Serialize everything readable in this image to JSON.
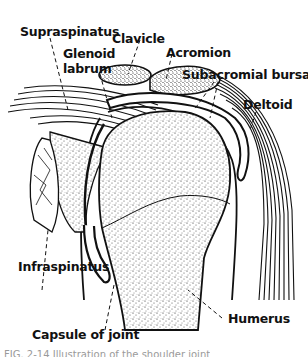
{
  "diagram": {
    "labels": {
      "supraspinatus": "Supraspinatus",
      "clavicle": "Clavicle",
      "glenoid_labrum_line1": "Glenoid",
      "glenoid_labrum_line2": "labrum",
      "acromion": "Acromion",
      "subacromial_bursa": "Subacromial bursa",
      "deltoid": "Deltoid",
      "infraspinatus": "Infraspinatus",
      "capsule_of_joint": "Capsule of joint",
      "humerus": "Humerus"
    },
    "caption": "FIG. 2-14 Illustration of the shoulder joint"
  },
  "colors": {
    "ink": "#111111",
    "background": "#ffffff",
    "caption": "#9a9a9a"
  }
}
